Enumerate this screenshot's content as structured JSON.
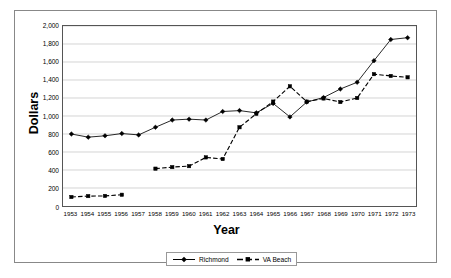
{
  "chart_data": {
    "type": "line",
    "title": "",
    "xlabel": "Year",
    "ylabel": "Dollars",
    "x": [
      1953,
      1954,
      1955,
      1956,
      1957,
      1958,
      1959,
      1960,
      1961,
      1962,
      1963,
      1964,
      1965,
      1966,
      1967,
      1968,
      1969,
      1970,
      1971,
      1972,
      1973
    ],
    "categories": [
      "1953",
      "1954",
      "1955",
      "1956",
      "1957",
      "1958",
      "1959",
      "1960",
      "1961",
      "1962",
      "1963",
      "1964",
      "1965",
      "1966",
      "1967",
      "1968",
      "1969",
      "1970",
      "1971",
      "1972",
      "1973"
    ],
    "series": [
      {
        "name": "Richmond",
        "marker": "diamond",
        "line_style": "solid",
        "color": "#000000",
        "values": [
          800,
          765,
          780,
          805,
          790,
          875,
          955,
          965,
          955,
          1050,
          1060,
          1035,
          1140,
          990,
          1155,
          1205,
          1300,
          1375,
          1615,
          1850,
          1870
        ]
      },
      {
        "name": "VA Beach",
        "marker": "square",
        "line_style": "dashed",
        "color": "#000000",
        "values": [
          100,
          110,
          112,
          125,
          null,
          415,
          432,
          443,
          540,
          522,
          875,
          1025,
          1160,
          1330,
          1160,
          1195,
          1155,
          1200,
          1465,
          1445,
          1430
        ]
      }
    ],
    "ylim": [
      0,
      2000
    ],
    "ytick_values": [
      0,
      200,
      400,
      600,
      800,
      1000,
      1200,
      1400,
      1600,
      1800,
      2000
    ],
    "ytick_labels": [
      "0",
      "200",
      "400",
      "600",
      "800",
      "1,000",
      "1,200",
      "1,400",
      "1,600",
      "1,800",
      "2,000"
    ],
    "grid": true,
    "grid_axis": "y",
    "legend_position": "bottom",
    "plot_background": "#ffffff",
    "grid_color": "#c9c9c9",
    "axis_color": "#555555"
  },
  "legend": {
    "entries": [
      {
        "label": "Richmond"
      },
      {
        "label": "VA Beach"
      }
    ]
  },
  "caption": {
    "text": ""
  }
}
